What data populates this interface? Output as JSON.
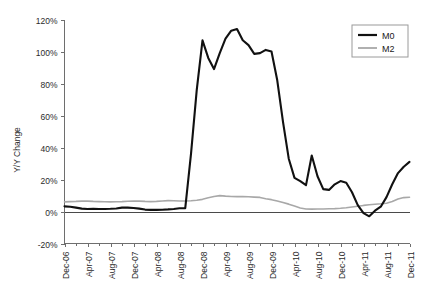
{
  "chart_data": {
    "type": "line",
    "title": "",
    "subtitle": "",
    "xlabel": "",
    "ylabel": "Y/Y Change",
    "ylim": [
      -20,
      120
    ],
    "ytick_labels": [
      "120%",
      "100%",
      "80%",
      "60%",
      "40%",
      "20%",
      "0%",
      "-20%"
    ],
    "ytick_values": [
      120,
      100,
      80,
      60,
      40,
      20,
      0,
      -20
    ],
    "grid": false,
    "legend_position": "top-right",
    "legend_entries": [
      "M0",
      "M2"
    ],
    "x_tick_labels": [
      "Dec-06",
      "Apr-07",
      "Aug-07",
      "Dec-07",
      "Apr-08",
      "Aug-08",
      "Dec-08",
      "Apr-09",
      "Aug-09",
      "Dec-09",
      "Apr-10",
      "Aug-10",
      "Dec-10",
      "Apr-11",
      "Aug-11",
      "Dec-11"
    ],
    "x_tick_interval_months": 4,
    "x_start": "Dec-06",
    "x_end": "Dec-11",
    "x_points_count": 61,
    "colors": {
      "m0": "#111111",
      "m2": "#a8a8a8",
      "axis": "#6e6e6e",
      "background": "#ffffff"
    },
    "series": [
      {
        "name": "M0",
        "color": "#111111",
        "linewidth": 2.1,
        "values": [
          3.2,
          3.0,
          2.4,
          1.8,
          1.6,
          1.7,
          1.6,
          1.6,
          1.7,
          1.9,
          2.4,
          2.4,
          2.2,
          1.8,
          1.2,
          1.0,
          1.0,
          1.1,
          1.3,
          1.6,
          2.0,
          2.1,
          36.0,
          76.0,
          107.0,
          96.0,
          89.0,
          99.0,
          108.0,
          113.0,
          114.0,
          107.0,
          104.0,
          98.5,
          99.0,
          101.0,
          100.0,
          82.0,
          56.0,
          33.0,
          21.0,
          19.0,
          16.5,
          35.0,
          22.0,
          14.0,
          13.5,
          17.0,
          19.0,
          18.0,
          12.0,
          4.0,
          -1.0,
          -3.0,
          0.5,
          3.0,
          9.0,
          17.0,
          24.0,
          28.0,
          31.0
        ]
      },
      {
        "name": "M2",
        "color": "#a8a8a8",
        "linewidth": 1.6,
        "values": [
          6.0,
          6.2,
          6.3,
          6.5,
          6.5,
          6.3,
          6.2,
          6.1,
          6.0,
          6.1,
          6.2,
          6.4,
          6.6,
          6.5,
          6.3,
          6.2,
          6.3,
          6.6,
          6.8,
          6.7,
          6.6,
          6.6,
          6.7,
          7.0,
          7.6,
          8.6,
          9.4,
          9.9,
          9.6,
          9.4,
          9.3,
          9.3,
          9.2,
          9.0,
          8.8,
          8.0,
          7.4,
          6.6,
          5.6,
          4.6,
          3.4,
          2.2,
          1.6,
          1.5,
          1.6,
          1.6,
          1.7,
          1.8,
          2.0,
          2.3,
          2.8,
          3.3,
          3.8,
          4.2,
          4.5,
          4.8,
          5.2,
          6.2,
          7.8,
          8.7,
          8.9
        ]
      }
    ]
  },
  "legend": {
    "items": [
      {
        "label": "M0"
      },
      {
        "label": "M2"
      }
    ]
  },
  "axes": {
    "y_title": "Y/Y Change"
  }
}
